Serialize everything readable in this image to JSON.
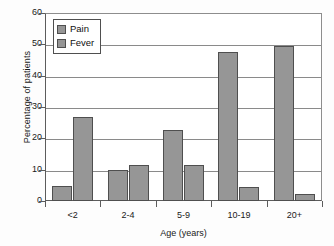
{
  "chart_data": {
    "type": "bar",
    "title": "",
    "xlabel": "Age (years)",
    "ylabel": "Percentage of patients",
    "categories": [
      "<2",
      "2-4",
      "5-9",
      "10-19",
      "20+"
    ],
    "series": [
      {
        "name": "Pain",
        "values": [
          4.8,
          9.8,
          22.8,
          47.5,
          49.5
        ]
      },
      {
        "name": "Fever",
        "values": [
          26.9,
          11.5,
          11.4,
          4.4,
          2.1
        ]
      }
    ],
    "ylim": [
      0,
      60
    ],
    "yticks": [
      0,
      10,
      20,
      30,
      40,
      50,
      60
    ],
    "ytick_labels": [
      "0",
      "10",
      "20",
      "30",
      "40",
      "50",
      "60"
    ],
    "grid": true,
    "grid_axis": "y",
    "legend_position": "upper left",
    "bar_color": "#969696",
    "bar_edge_color": "#4f4f4f",
    "axis_color": "#5c5c5c"
  },
  "legend": {
    "items": [
      {
        "label": "Pain"
      },
      {
        "label": "Fever"
      }
    ]
  }
}
